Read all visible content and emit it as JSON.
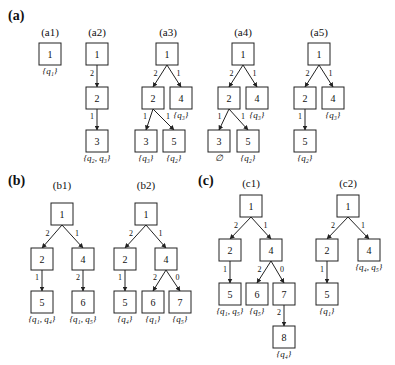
{
  "figure": {
    "panels": [
      {
        "id": "a",
        "label": "(a)",
        "x": 8,
        "y": 20
      },
      {
        "id": "b",
        "label": "(b)",
        "x": 8,
        "y": 185
      },
      {
        "id": "c",
        "label": "(c)",
        "x": 198,
        "y": 185
      }
    ],
    "node_size": 22,
    "trees": [
      {
        "id": "a1",
        "title": "(a1)",
        "title_x": 50,
        "title_y": 36,
        "nodes": [
          {
            "id": "1",
            "label": "1",
            "x": 50,
            "y": 54,
            "set": "{q₁}"
          }
        ],
        "edges": []
      },
      {
        "id": "a2",
        "title": "(a2)",
        "title_x": 97,
        "title_y": 36,
        "nodes": [
          {
            "id": "1",
            "label": "1",
            "x": 97,
            "y": 54,
            "set": ""
          },
          {
            "id": "2",
            "label": "2",
            "x": 97,
            "y": 98,
            "set": ""
          },
          {
            "id": "3",
            "label": "3",
            "x": 97,
            "y": 141,
            "set": "{q₂, q₃}"
          }
        ],
        "edges": [
          {
            "from": "1",
            "to": "2",
            "label": "2"
          },
          {
            "from": "2",
            "to": "3",
            "label": "1"
          }
        ]
      },
      {
        "id": "a3",
        "title": "(a3)",
        "title_x": 168,
        "title_y": 36,
        "nodes": [
          {
            "id": "1",
            "label": "1",
            "x": 167,
            "y": 54,
            "set": ""
          },
          {
            "id": "2",
            "label": "2",
            "x": 153,
            "y": 98,
            "set": ""
          },
          {
            "id": "4",
            "label": "4",
            "x": 181,
            "y": 98,
            "set": "{q₃}"
          },
          {
            "id": "3",
            "label": "3",
            "x": 146,
            "y": 141,
            "set": "{q₃}"
          },
          {
            "id": "5",
            "label": "5",
            "x": 174,
            "y": 141,
            "set": "{q₂}"
          }
        ],
        "edges": [
          {
            "from": "1",
            "to": "2",
            "label": "2"
          },
          {
            "from": "1",
            "to": "4",
            "label": "1"
          },
          {
            "from": "2",
            "to": "3",
            "label": "1"
          },
          {
            "from": "2",
            "to": "5",
            "label": "1"
          }
        ]
      },
      {
        "id": "a4",
        "title": "(a4)",
        "title_x": 243,
        "title_y": 36,
        "nodes": [
          {
            "id": "1",
            "label": "1",
            "x": 243,
            "y": 54,
            "set": ""
          },
          {
            "id": "2",
            "label": "2",
            "x": 229,
            "y": 98,
            "set": ""
          },
          {
            "id": "4",
            "label": "4",
            "x": 257,
            "y": 98,
            "set": "{q₃}"
          },
          {
            "id": "3",
            "label": "3",
            "x": 219,
            "y": 141,
            "set": "∅"
          },
          {
            "id": "5",
            "label": "5",
            "x": 248,
            "y": 141,
            "set": "{q₂}"
          }
        ],
        "edges": [
          {
            "from": "1",
            "to": "2",
            "label": "2"
          },
          {
            "from": "1",
            "to": "4",
            "label": "1"
          },
          {
            "from": "2",
            "to": "3",
            "label": "1"
          },
          {
            "from": "2",
            "to": "5",
            "label": "1"
          }
        ]
      },
      {
        "id": "a5",
        "title": "(a5)",
        "title_x": 319,
        "title_y": 36,
        "nodes": [
          {
            "id": "1",
            "label": "1",
            "x": 319,
            "y": 54,
            "set": ""
          },
          {
            "id": "2",
            "label": "2",
            "x": 305,
            "y": 98,
            "set": ""
          },
          {
            "id": "4",
            "label": "4",
            "x": 333,
            "y": 98,
            "set": "{q₃}"
          },
          {
            "id": "5",
            "label": "5",
            "x": 305,
            "y": 141,
            "set": "{q₂}"
          }
        ],
        "edges": [
          {
            "from": "1",
            "to": "2",
            "label": "2"
          },
          {
            "from": "1",
            "to": "4",
            "label": "1"
          },
          {
            "from": "2",
            "to": "5",
            "label": "1"
          }
        ]
      },
      {
        "id": "b1",
        "title": "(b1)",
        "title_x": 62,
        "title_y": 189,
        "nodes": [
          {
            "id": "1",
            "label": "1",
            "x": 62,
            "y": 214,
            "set": ""
          },
          {
            "id": "2",
            "label": "2",
            "x": 42,
            "y": 259,
            "set": ""
          },
          {
            "id": "4",
            "label": "4",
            "x": 83,
            "y": 259,
            "set": ""
          },
          {
            "id": "5",
            "label": "5",
            "x": 42,
            "y": 302,
            "set": "{q₁, q₄}"
          },
          {
            "id": "6",
            "label": "6",
            "x": 83,
            "y": 302,
            "set": "{q₁, q₅}"
          }
        ],
        "edges": [
          {
            "from": "1",
            "to": "2",
            "label": "2"
          },
          {
            "from": "1",
            "to": "4",
            "label": "1"
          },
          {
            "from": "2",
            "to": "5",
            "label": "1"
          },
          {
            "from": "4",
            "to": "6",
            "label": "2"
          }
        ]
      },
      {
        "id": "b2",
        "title": "(b2)",
        "title_x": 146,
        "title_y": 189,
        "nodes": [
          {
            "id": "1",
            "label": "1",
            "x": 146,
            "y": 214,
            "set": ""
          },
          {
            "id": "2",
            "label": "2",
            "x": 125,
            "y": 259,
            "set": ""
          },
          {
            "id": "4",
            "label": "4",
            "x": 166,
            "y": 259,
            "set": ""
          },
          {
            "id": "5",
            "label": "5",
            "x": 125,
            "y": 302,
            "set": "{q₄}"
          },
          {
            "id": "6",
            "label": "6",
            "x": 153,
            "y": 302,
            "set": "{q₁}"
          },
          {
            "id": "7",
            "label": "7",
            "x": 180,
            "y": 302,
            "set": "{q₅}"
          }
        ],
        "edges": [
          {
            "from": "1",
            "to": "2",
            "label": "2"
          },
          {
            "from": "1",
            "to": "4",
            "label": "1"
          },
          {
            "from": "2",
            "to": "5",
            "label": "1"
          },
          {
            "from": "4",
            "to": "6",
            "label": "2"
          },
          {
            "from": "4",
            "to": "7",
            "label": "0"
          }
        ]
      },
      {
        "id": "c1",
        "title": "(c1)",
        "title_x": 251,
        "title_y": 187,
        "nodes": [
          {
            "id": "1",
            "label": "1",
            "x": 251,
            "y": 206,
            "set": ""
          },
          {
            "id": "2",
            "label": "2",
            "x": 230,
            "y": 250,
            "set": ""
          },
          {
            "id": "4",
            "label": "4",
            "x": 271,
            "y": 250,
            "set": ""
          },
          {
            "id": "5",
            "label": "5",
            "x": 230,
            "y": 294,
            "set": "{q₁, q₅}"
          },
          {
            "id": "6",
            "label": "6",
            "x": 257,
            "y": 294,
            "set": "{q₅}"
          },
          {
            "id": "7",
            "label": "7",
            "x": 284,
            "y": 294,
            "set": ""
          },
          {
            "id": "8",
            "label": "8",
            "x": 284,
            "y": 337,
            "set": "{q₄}"
          }
        ],
        "edges": [
          {
            "from": "1",
            "to": "2",
            "label": "2"
          },
          {
            "from": "1",
            "to": "4",
            "label": "1"
          },
          {
            "from": "2",
            "to": "5",
            "label": "1"
          },
          {
            "from": "4",
            "to": "6",
            "label": "2"
          },
          {
            "from": "4",
            "to": "7",
            "label": "0"
          },
          {
            "from": "7",
            "to": "8",
            "label": "2"
          }
        ]
      },
      {
        "id": "c2",
        "title": "(c2)",
        "title_x": 348,
        "title_y": 187,
        "nodes": [
          {
            "id": "1",
            "label": "1",
            "x": 348,
            "y": 206,
            "set": ""
          },
          {
            "id": "2",
            "label": "2",
            "x": 327,
            "y": 250,
            "set": ""
          },
          {
            "id": "4",
            "label": "4",
            "x": 369,
            "y": 250,
            "set": "{q₄, q₅}"
          },
          {
            "id": "5",
            "label": "5",
            "x": 327,
            "y": 294,
            "set": "{q₁}"
          }
        ],
        "edges": [
          {
            "from": "1",
            "to": "2",
            "label": "2"
          },
          {
            "from": "1",
            "to": "4",
            "label": "1"
          },
          {
            "from": "2",
            "to": "5",
            "label": "1"
          }
        ]
      }
    ]
  }
}
